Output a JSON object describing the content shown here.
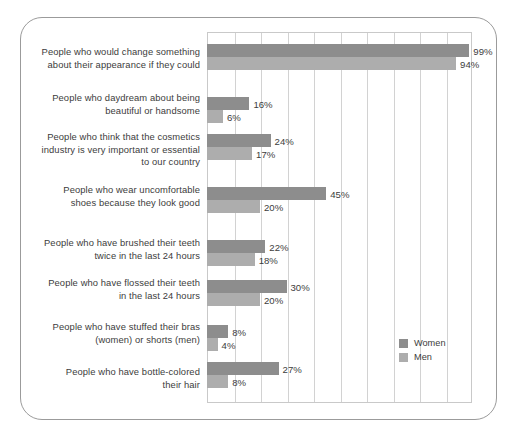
{
  "chart_data": {
    "type": "bar",
    "orientation": "horizontal",
    "title": "",
    "subtitle": "",
    "xlabel": "",
    "ylabel": "",
    "xlim": [
      0,
      100
    ],
    "xticks": [
      0,
      10,
      20,
      30,
      40,
      50,
      60,
      70,
      80,
      90,
      100
    ],
    "grid": "vertical",
    "value_suffix": "%",
    "legend": {
      "position": "bottom-right",
      "entries": [
        {
          "name": "Women",
          "color": "#8d8d8d"
        },
        {
          "name": "Men",
          "color": "#adadad"
        }
      ]
    },
    "categories": [
      "People who would change something about their appearance if they could",
      "People who daydream about being beautiful or handsome",
      "People who think that the cosmetics industry is very important or essential to our country",
      "People who wear uncomfortable shoes because they look good",
      "People who have brushed their teeth twice in the last 24 hours",
      "People who have flossed their teeth in the last 24 hours",
      "People who have stuffed their bras (women) or shorts (men)",
      "People who have bottle-colored their hair"
    ],
    "series": [
      {
        "name": "Women",
        "color": "#8d8d8d",
        "values": [
          99,
          16,
          24,
          45,
          22,
          30,
          8,
          27
        ]
      },
      {
        "name": "Men",
        "color": "#adadad",
        "values": [
          94,
          6,
          17,
          20,
          18,
          20,
          4,
          8
        ]
      }
    ],
    "data_labels": {
      "Women": [
        "99%",
        "16%",
        "24%",
        "45%",
        "22%",
        "30%",
        "8%",
        "27%"
      ],
      "Men": [
        "94%",
        "6%",
        "17%",
        "20%",
        "18%",
        "20%",
        "4%",
        "8%"
      ]
    }
  },
  "rows": [
    {
      "label_lines": [
        "People who would change something",
        "about their appearance if they could"
      ],
      "women_value": "99%",
      "men_value": "94%"
    },
    {
      "label_lines": [
        "People who daydream about being",
        "beautiful or handsome"
      ],
      "women_value": "16%",
      "men_value": "6%"
    },
    {
      "label_lines": [
        "People who think that the cosmetics",
        "industry is very important or essential",
        "to our country"
      ],
      "women_value": "24%",
      "men_value": "17%"
    },
    {
      "label_lines": [
        "People who wear uncomfortable",
        "shoes because they look good"
      ],
      "women_value": "45%",
      "men_value": "20%"
    },
    {
      "label_lines": [
        "People who have brushed their teeth",
        "twice in the last 24 hours"
      ],
      "women_value": "22%",
      "men_value": "18%"
    },
    {
      "label_lines": [
        "People who have flossed their teeth",
        "in the last 24 hours"
      ],
      "women_value": "30%",
      "men_value": "20%"
    },
    {
      "label_lines": [
        "People who have stuffed their bras",
        "(women) or shorts (men)"
      ],
      "women_value": "8%",
      "men_value": "4%"
    },
    {
      "label_lines": [
        "People who have bottle-colored",
        "their hair"
      ],
      "women_value": "27%",
      "men_value": "8%"
    }
  ],
  "legend": {
    "women_label": "Women",
    "men_label": "Men"
  }
}
